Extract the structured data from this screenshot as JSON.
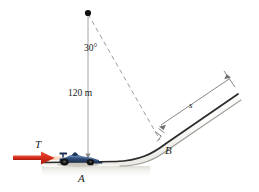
{
  "figure": {
    "type": "mechanics-free-body-diagram",
    "background_color": "#ffffff"
  },
  "labels": {
    "angle": "30°",
    "height": "120 m",
    "arc_length": "s",
    "point_a": "A",
    "point_b": "B",
    "force_t": "T"
  },
  "geometry": {
    "apex": {
      "x": 88,
      "y": 13
    },
    "point_a": {
      "x": 88,
      "y": 160
    },
    "point_b": {
      "x": 162,
      "y": 140
    },
    "vertical_drop_px": 147,
    "incline_end": {
      "x": 238,
      "y": 96
    }
  },
  "colors": {
    "leader_line": "#8a8a8a",
    "dashed_line": "#909090",
    "dimension_line": "#707070",
    "ground_surface": "#2b2b2b",
    "ground_fill": "#c9c5b4",
    "incline_fill": "#f2f2f0",
    "incline_edge": "#3a3a3a",
    "force_arrow": "#d62b1a",
    "force_arrow_dark": "#a81d10",
    "apex_dot": "#111111",
    "car_body": "#2d4a7a",
    "car_body_light": "#4a6fa5",
    "car_dark": "#1b2d4d",
    "text": "#1a1a1a"
  },
  "elements": {
    "apex_point_name": "apex-point",
    "vertical_line_name": "vertical-height-line",
    "dashed_line_name": "dashed-angle-line",
    "right_angle_name": "right-angle-marker",
    "dimension_name": "arc-length-dimension",
    "car_name": "race-car",
    "ground_name": "ground-surface"
  }
}
